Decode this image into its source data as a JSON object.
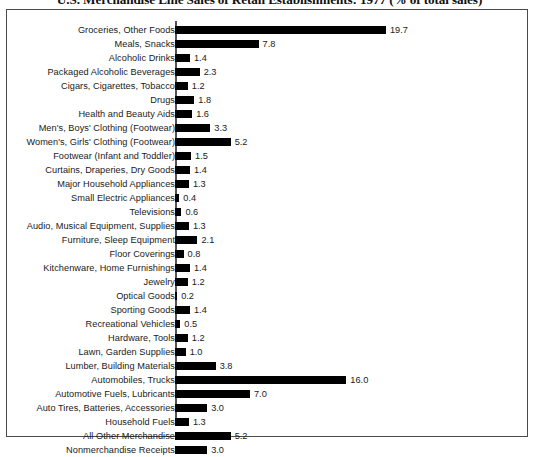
{
  "chart_data": {
    "type": "bar",
    "orientation": "horizontal",
    "title": "U.S. Merchandise Line Sales of Retail Establishments: 1977 (% of total sales)",
    "xlabel": "",
    "ylabel": "",
    "xlim": [
      0,
      20
    ],
    "grid": false,
    "legend": null,
    "value_format": "one-decimal",
    "categories": [
      "Groceries, Other Foods",
      "Meals, Snacks",
      "Alcoholic Drinks",
      "Packaged Alcoholic Beverages",
      "Cigars, Cigarettes, Tobacco",
      "Drugs",
      "Health and Beauty Aids",
      "Men's, Boys' Clothing (Footwear)",
      "Women's, Girls' Clothing (Footwear)",
      "Footwear (Infant and Toddler)",
      "Curtains, Draperies, Dry Goods",
      "Major Household Appliances",
      "Small Electric Appliances",
      "Televisions",
      "Audio, Musical Equipment, Supplies",
      "Furniture, Sleep Equipment",
      "Floor Coverings",
      "Kitchenware, Home Furnishings",
      "Jewelry",
      "Optical Goods",
      "Sporting Goods",
      "Recreational Vehicles",
      "Hardware, Tools",
      "Lawn, Garden Supplies",
      "Lumber, Building Materials",
      "Automobiles, Trucks",
      "Automotive Fuels, Lubricants",
      "Auto Tires, Batteries, Accessories",
      "Household Fuels",
      "All Other Merchandise",
      "Nonmerchandise Receipts"
    ],
    "values": [
      19.7,
      7.8,
      1.4,
      2.3,
      1.2,
      1.8,
      1.6,
      3.3,
      5.2,
      1.5,
      1.4,
      1.3,
      0.4,
      0.6,
      1.3,
      2.1,
      0.8,
      1.4,
      1.2,
      0.2,
      1.4,
      0.5,
      1.2,
      1.0,
      3.8,
      16.0,
      7.0,
      3.0,
      1.3,
      5.2,
      3.0
    ],
    "value_labels": [
      "19.7",
      "7.8",
      "1.4",
      "2.3",
      "1.2",
      "1.8",
      "1.6",
      "3.3",
      "5.2",
      "1.5",
      "1.4",
      "1.3",
      "0.4",
      "0.6",
      "1.3",
      "2.1",
      "0.8",
      "1.4",
      "1.2",
      "0.2",
      "1.4",
      "0.5",
      "1.2",
      "1.0",
      "3.8",
      "16.0",
      "7.0",
      "3.0",
      "1.3",
      "5.2",
      "3.0"
    ],
    "colors": {
      "bar": "#000000",
      "background": "#ffffff",
      "frame": "#4a4a4a",
      "text": "#1a1a1a"
    }
  }
}
